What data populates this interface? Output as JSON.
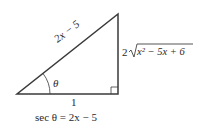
{
  "diagram": {
    "type": "right-triangle",
    "hypotenuse_label": "2x − 5",
    "opposite_label_coef": "2",
    "opposite_label_radicand": "x² − 5x + 6",
    "adjacent_label": "1",
    "angle_label": "θ",
    "caption": "sec θ = 2x − 5",
    "colors": {
      "stroke": "#3a3a3a",
      "text": "#2a2a2a"
    }
  }
}
